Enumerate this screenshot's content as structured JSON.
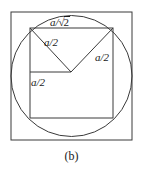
{
  "figure": {
    "caption": "(b)",
    "stroke_color": "#3a3a3a",
    "text_color": "#1a1a1a",
    "background_color": "#ffffff",
    "labels": {
      "hypotenuse_numerator": "a/",
      "hypotenuse_radical": "√",
      "hypotenuse_radicand": "2",
      "hypotenuse_full": "a/√2",
      "left_diagonal": "a/2",
      "right_diagonal": "a/2",
      "left_side": "a/2"
    },
    "shapes": {
      "outer_square": {
        "name": "outer-square",
        "x": 11,
        "y": 12,
        "width": 121,
        "height": 128
      },
      "circle": {
        "name": "inscribed-circle",
        "cx": 71.5,
        "cy": 76,
        "r": 60.5
      },
      "inner_square": {
        "name": "inner-square",
        "x": 30,
        "y": 28,
        "width": 83,
        "height": 90
      },
      "triangle": {
        "name": "inscribed-triangle",
        "points": "30,28 71,72 113,28"
      },
      "midline": {
        "name": "horizontal-midline",
        "x1": 30,
        "y1": 72,
        "x2": 71,
        "y2": 72
      }
    }
  }
}
